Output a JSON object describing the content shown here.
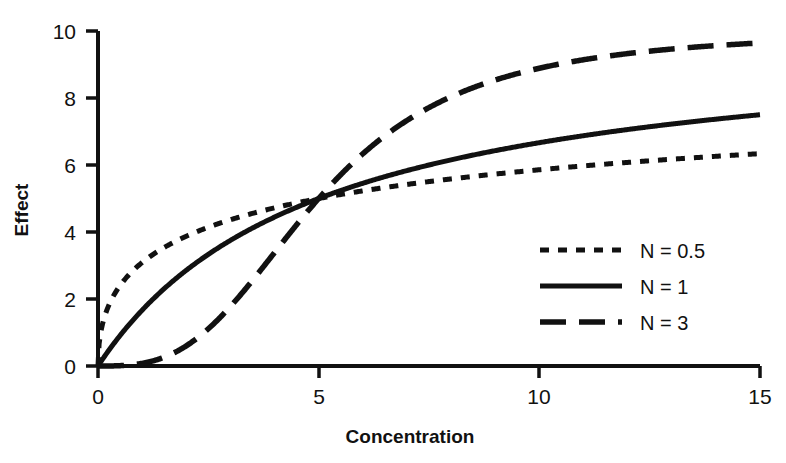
{
  "chart_data": {
    "type": "line",
    "title": "",
    "xlabel": "Concentration",
    "ylabel": "Effect",
    "xlim": [
      0,
      15
    ],
    "ylim": [
      0,
      10
    ],
    "xticks": [
      "0",
      "5",
      "10",
      "15"
    ],
    "xtick_values": [
      0,
      5,
      10,
      15
    ],
    "yticks": [
      "0",
      "2",
      "4",
      "6",
      "8",
      "10"
    ],
    "ytick_values": [
      0,
      2,
      4,
      6,
      8,
      10
    ],
    "grid": false,
    "legend_position": "center-right",
    "model": "Hill equation: Effect = Emax * C^N / (EC50^N + C^N), Emax = 10, EC50 = 5",
    "emax": 10,
    "ec50": 5,
    "x": [
      0,
      0.25,
      0.5,
      0.75,
      1,
      1.5,
      2,
      2.5,
      3,
      3.5,
      4,
      4.5,
      5,
      5.5,
      6,
      7,
      8,
      9,
      10,
      11,
      12,
      13,
      14,
      15
    ],
    "series": [
      {
        "name": "N = 0.5",
        "hill_n": 0.5,
        "dash": "dotted",
        "color": "#111111",
        "values": [
          0,
          1.83,
          2.41,
          2.78,
          3.09,
          3.53,
          3.87,
          4.14,
          4.36,
          4.56,
          4.72,
          4.87,
          5.0,
          5.12,
          5.23,
          5.42,
          5.59,
          5.73,
          5.86,
          5.97,
          6.07,
          6.16,
          6.24,
          6.32
        ]
      },
      {
        "name": "N = 1",
        "hill_n": 1,
        "dash": "solid",
        "color": "#111111",
        "values": [
          0,
          0.48,
          0.91,
          1.3,
          1.67,
          2.31,
          2.86,
          3.33,
          3.75,
          4.12,
          4.44,
          4.74,
          5.0,
          5.24,
          5.45,
          5.83,
          6.15,
          6.43,
          6.67,
          6.88,
          7.06,
          7.22,
          7.37,
          7.5
        ]
      },
      {
        "name": "N = 3",
        "hill_n": 3,
        "dash": "dashed",
        "color": "#111111",
        "values": [
          0,
          0.01,
          0.1,
          0.33,
          0.79,
          2.44,
          4.24,
          5.56,
          6.82,
          7.75,
          8.38,
          8.81,
          9.12,
          9.36,
          9.53,
          9.76,
          9.88,
          9.94,
          9.97,
          9.98,
          9.99,
          9.99,
          10.0,
          10.0
        ]
      }
    ],
    "legend_entries": [
      {
        "label": "N = 0.5",
        "dash": "dotted"
      },
      {
        "label": "N = 1",
        "dash": "solid"
      },
      {
        "label": "N = 3",
        "dash": "dashed"
      }
    ]
  }
}
